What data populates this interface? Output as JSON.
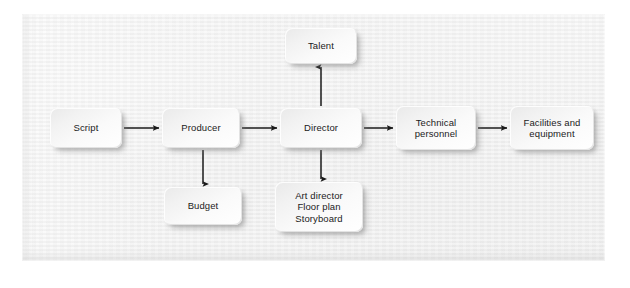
{
  "figure": {
    "type": "flowchart",
    "orientation": "left-to-right",
    "background_color": "#ffffff",
    "panel_color": "#efefef",
    "node_fill_color": "#f5f5f5",
    "connector_color": "#1a1a1a",
    "text_color": "#1b1b1b"
  },
  "nodes": [
    {
      "id": "script",
      "label": "Script",
      "x": 28,
      "y": 94,
      "w": 72,
      "h": 40
    },
    {
      "id": "producer",
      "label": "Producer",
      "x": 140,
      "y": 94,
      "w": 78,
      "h": 40
    },
    {
      "id": "director",
      "label": "Director",
      "x": 258,
      "y": 94,
      "w": 82,
      "h": 40
    },
    {
      "id": "technical",
      "label": "Technical\npersonnel",
      "x": 374,
      "y": 92,
      "w": 80,
      "h": 44
    },
    {
      "id": "facilities",
      "label": "Facilities and\nequipment",
      "x": 488,
      "y": 92,
      "w": 84,
      "h": 44
    },
    {
      "id": "talent",
      "label": "Talent",
      "x": 263,
      "y": 14,
      "w": 72,
      "h": 36
    },
    {
      "id": "budget",
      "label": "Budget",
      "x": 142,
      "y": 173,
      "w": 78,
      "h": 38
    },
    {
      "id": "art",
      "label": "Art director\nFloor plan\nStoryboard",
      "x": 253,
      "y": 168,
      "w": 88,
      "h": 50
    }
  ],
  "edges": [
    {
      "id": "script-to-producer",
      "from": "script",
      "to": "producer",
      "direction": "right",
      "arrow": true
    },
    {
      "id": "producer-to-director",
      "from": "producer",
      "to": "director",
      "direction": "right",
      "arrow": true
    },
    {
      "id": "director-to-technical",
      "from": "director",
      "to": "technical",
      "direction": "right",
      "arrow": true
    },
    {
      "id": "technical-to-facilities",
      "from": "technical",
      "to": "facilities",
      "direction": "right",
      "arrow": true
    },
    {
      "id": "director-to-talent",
      "from": "director",
      "to": "talent",
      "direction": "up",
      "arrow": true
    },
    {
      "id": "producer-to-budget",
      "from": "producer",
      "to": "budget",
      "direction": "down",
      "arrow": true
    },
    {
      "id": "director-to-art",
      "from": "director",
      "to": "art",
      "direction": "down",
      "arrow": true
    }
  ]
}
